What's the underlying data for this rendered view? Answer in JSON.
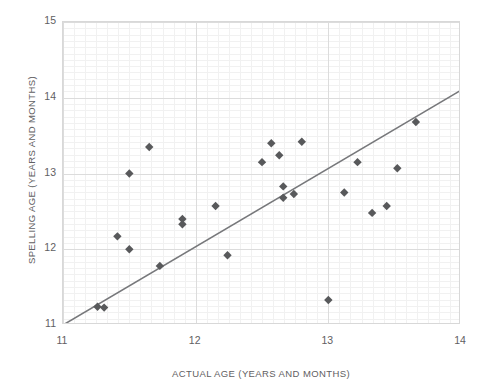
{
  "chart_data": {
    "type": "scatter",
    "title": "",
    "xlabel": "ACTUAL AGE (YEARS AND MONTHS)",
    "ylabel": "SPELLING AGE (YEARS AND MONTHS)",
    "xlim": [
      11,
      14
    ],
    "ylim": [
      11,
      15
    ],
    "xticks": [
      11,
      12,
      13,
      14
    ],
    "yticks": [
      11,
      12,
      13,
      14,
      15
    ],
    "xtick_labels": [
      "11",
      "12",
      "13",
      "14"
    ],
    "ytick_labels": [
      "11",
      "12",
      "13",
      "14",
      "15"
    ],
    "grid": true,
    "grid_minor_steps_per_unit": 12,
    "legend": "none",
    "marker_shape": "diamond",
    "marker_color": "#58595b",
    "trendline": {
      "type": "linear",
      "color": "#77787b",
      "x": [
        11.0,
        14.0
      ],
      "y": [
        11.0,
        14.1
      ]
    },
    "points": [
      {
        "x": 11.26,
        "y": 11.24
      },
      {
        "x": 11.31,
        "y": 11.23
      },
      {
        "x": 11.41,
        "y": 12.17
      },
      {
        "x": 11.5,
        "y": 12.0
      },
      {
        "x": 11.5,
        "y": 13.0
      },
      {
        "x": 11.65,
        "y": 13.35
      },
      {
        "x": 11.73,
        "y": 11.78
      },
      {
        "x": 11.9,
        "y": 12.4
      },
      {
        "x": 11.9,
        "y": 12.33
      },
      {
        "x": 12.15,
        "y": 12.57
      },
      {
        "x": 12.24,
        "y": 11.92
      },
      {
        "x": 12.5,
        "y": 13.15
      },
      {
        "x": 12.57,
        "y": 13.4
      },
      {
        "x": 12.63,
        "y": 13.24
      },
      {
        "x": 12.66,
        "y": 12.83
      },
      {
        "x": 12.66,
        "y": 12.68
      },
      {
        "x": 12.74,
        "y": 12.73
      },
      {
        "x": 12.8,
        "y": 13.42
      },
      {
        "x": 13.0,
        "y": 11.33
      },
      {
        "x": 13.12,
        "y": 12.75
      },
      {
        "x": 13.22,
        "y": 13.15
      },
      {
        "x": 13.33,
        "y": 12.48
      },
      {
        "x": 13.44,
        "y": 12.57
      },
      {
        "x": 13.52,
        "y": 13.07
      },
      {
        "x": 13.66,
        "y": 13.68
      }
    ]
  }
}
